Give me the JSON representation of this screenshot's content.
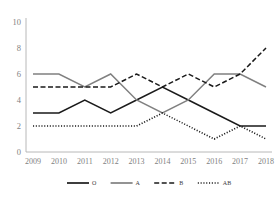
{
  "chart_data": {
    "type": "line",
    "title": "",
    "xlabel": "",
    "ylabel": "",
    "ylim": [
      0,
      10
    ],
    "yticks": [
      0,
      2,
      4,
      6,
      8,
      10
    ],
    "grid": false,
    "legend_position": "bottom",
    "categories": [
      "2009",
      "2010",
      "2011",
      "2012",
      "2013",
      "2014",
      "2015",
      "2016",
      "2017",
      "2018"
    ],
    "series": [
      {
        "name": "O",
        "style": "solid",
        "color": "#1a1a1a",
        "values": [
          3,
          3,
          4,
          3,
          4,
          5,
          4,
          3,
          2,
          2
        ]
      },
      {
        "name": "A",
        "style": "solid",
        "color": "#808080",
        "values": [
          6,
          6,
          5,
          6,
          4,
          3,
          4,
          6,
          6,
          5
        ]
      },
      {
        "name": "B",
        "style": "dashed",
        "color": "#1a1a1a",
        "values": [
          5,
          5,
          5,
          5,
          6,
          5,
          6,
          5,
          6,
          8
        ]
      },
      {
        "name": "AB",
        "style": "dotted",
        "color": "#1a1a1a",
        "values": [
          2,
          2,
          2,
          2,
          2,
          3,
          2,
          1,
          2,
          1
        ]
      }
    ]
  },
  "legend": {
    "items": [
      {
        "label": "O",
        "marker": "solid-line-swatch"
      },
      {
        "label": "A",
        "marker": "gray-line-swatch"
      },
      {
        "label": "B",
        "marker": "dashed-line-swatch"
      },
      {
        "label": "AB",
        "marker": "dotted-line-swatch"
      }
    ]
  }
}
